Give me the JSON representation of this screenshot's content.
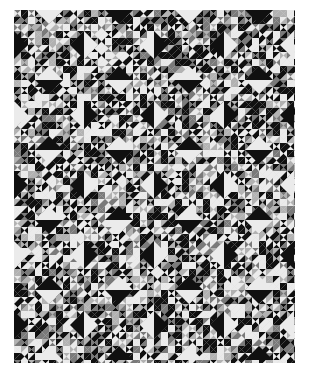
{
  "image": {
    "subject": "Ocean Waves patchwork quilt",
    "description": "Black-and-white photograph of a pieced quilt made of many small half-square triangles arranged in blocks with large solid triangles forming diamonds",
    "colors": {
      "background": "#ffffff",
      "dark": "#151515",
      "mid": "#7a7a7a",
      "light": "#e6e6e6",
      "fabric_base": "#d6d6d6"
    }
  },
  "quilt": {
    "columns": 4,
    "rows": 5,
    "block_size": 70,
    "small_triangle_grid": 7,
    "large_triangle_base": 28,
    "large_triangle_height": 14,
    "pattern": "checkerboard: even blocks have light top/bottom and dark left/right large triangles; odd blocks inverted"
  }
}
